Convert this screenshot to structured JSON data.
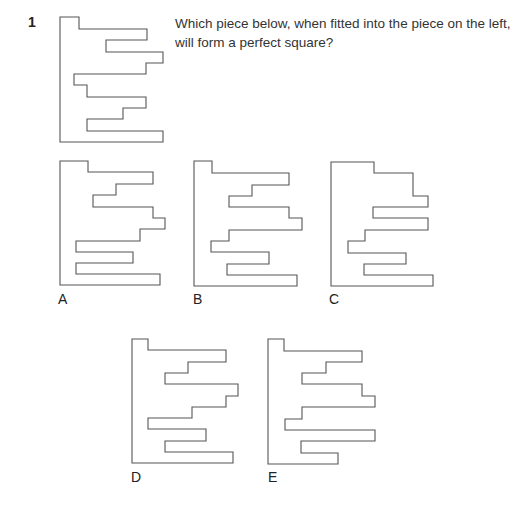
{
  "question": {
    "number": "1",
    "text_lines": [
      "Which piece below, when fitted into the piece on the left,",
      "will form a perfect square?"
    ]
  },
  "pieces": {
    "main": {
      "points": "60,17 79,17 79,29 147,29 147,40 106,40 106,52 163,52 163,63 146,63 146,74 74,74 74,85 87,85 87,97 146,97 146,108 123,108 123,119 87,119 87,131 163,131 163,142 60,142"
    },
    "options": [
      {
        "label": "A",
        "points": "60,161 88,161 88,172 153,172 153,184 116,184 116,195 93,195 93,207 153,207 153,218 165,218 165,229 140,229 140,241 76,241 76,252 133,252 133,263 76,263 76,274 160,274 160,285 60,285"
      },
      {
        "label": "B",
        "points": "194,161 212,161 212,173 289,173 289,185 252,185 252,196 229,196 229,207 289,207 289,218 302,218 302,230 229,230 229,241 211,241 211,252 269,252 269,264 227,264 227,275 297,275 297,286 194,286"
      },
      {
        "label": "C",
        "points": "331,162 374,162 374,173 413,173 413,196 428,196 428,207 373,207 373,218 428,218 428,230 365,230 365,241 348,241 348,253 406,253 406,264 364,264 364,275 433,275 433,286 331,286"
      },
      {
        "label": "D",
        "points": "132,339 148,339 148,350 226,350 226,362 188,362 188,373 165,373 165,384 238,384 238,396 226,396 226,407 192,407 192,418 148,418 148,429 206,429 206,441 165,441 165,452 233,452 233,463 132,463"
      },
      {
        "label": "E",
        "points": "268,339 284,339 284,351 362,351 362,362 326,362 326,373 302,373 302,384 362,384 362,396 375,396 375,407 302,407 302,419 285,419 285,430 375,430 375,441 301,441 301,453 338,453 338,464 268,464"
      }
    ]
  },
  "colors": {
    "stroke": "#555555",
    "text": "#333333",
    "background": "#ffffff"
  }
}
